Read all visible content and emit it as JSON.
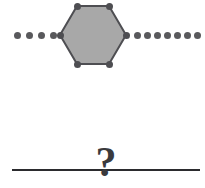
{
  "figure": {
    "background_color": "#ffffff",
    "width": 205,
    "height": 188,
    "top_row": {
      "description": "dotted-line-with-hexagon",
      "dot_color": "#59595c",
      "dot_diameter": 7,
      "left_dots": [
        {
          "x": 14,
          "y": 32
        },
        {
          "x": 26,
          "y": 32
        },
        {
          "x": 38,
          "y": 32
        },
        {
          "x": 50,
          "y": 32
        }
      ],
      "right_dots": [
        {
          "x": 134,
          "y": 32
        },
        {
          "x": 144,
          "y": 32
        },
        {
          "x": 154,
          "y": 32
        },
        {
          "x": 164,
          "y": 32
        },
        {
          "x": 174,
          "y": 32
        },
        {
          "x": 184,
          "y": 32
        },
        {
          "x": 194,
          "y": 32
        }
      ],
      "hexagon": {
        "fill_color": "#a8a8a8",
        "stroke_color": "#4e4e52",
        "stroke_width": 2,
        "vertex_color": "#4e4e52",
        "vertex_diameter": 7,
        "center_x": 93,
        "center_y": 35,
        "width": 66,
        "height": 60,
        "vertices": [
          {
            "x": 2,
            "y": 33
          },
          {
            "x": 19,
            "y": 4
          },
          {
            "x": 51,
            "y": 4
          },
          {
            "x": 68,
            "y": 33
          },
          {
            "x": 51,
            "y": 62
          },
          {
            "x": 19,
            "y": 62
          }
        ]
      }
    },
    "bottom_row": {
      "description": "solid-line-with-question-mark",
      "line_color": "#2b2b2e",
      "line_x": 12,
      "line_y": 169,
      "line_width": 188,
      "line_height": 2,
      "question_mark": "?",
      "question_mark_color": "#3a3a3d"
    }
  }
}
